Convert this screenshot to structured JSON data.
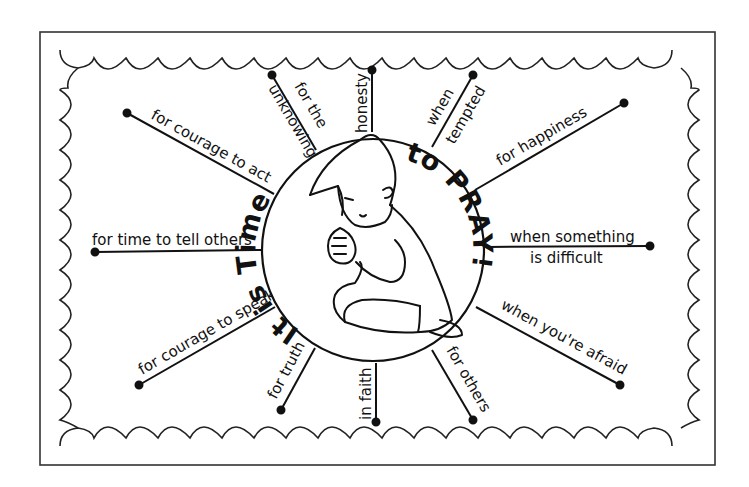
{
  "poster": {
    "title_left": "It is Time",
    "title_right": "to PRAY!",
    "colors": {
      "ink": "#111111",
      "paper": "#ffffff",
      "frame": "#333333"
    },
    "spokes": [
      {
        "id": "courage-to-act",
        "label": "for courage to act"
      },
      {
        "id": "unknowing",
        "label_line1": "for the",
        "label_line2": "unknowing"
      },
      {
        "id": "honesty",
        "label": "honesty"
      },
      {
        "id": "tempted",
        "label_line1": "when",
        "label_line2": "tempted"
      },
      {
        "id": "happiness",
        "label": "for happiness"
      },
      {
        "id": "time-to-tell",
        "label": "for time to tell others"
      },
      {
        "id": "difficult",
        "label_line1": "when something",
        "label_line2": "is difficult"
      },
      {
        "id": "courage-to-speak",
        "label": "for courage to speak"
      },
      {
        "id": "truth",
        "label": "for truth"
      },
      {
        "id": "faith",
        "label": "in faith"
      },
      {
        "id": "others",
        "label": "for others"
      },
      {
        "id": "afraid",
        "label": "when you're afraid"
      }
    ],
    "illustration": "praying-child"
  }
}
